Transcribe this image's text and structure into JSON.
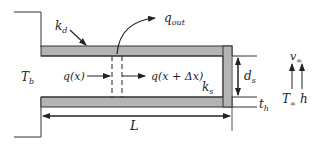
{
  "diagram": {
    "colors": {
      "wall_fill": "#b4b4b4",
      "wall_stroke": "#333333",
      "line": "#333333",
      "background": "#ffffff"
    },
    "labels": {
      "k_d": "k",
      "k_d_sub": "d",
      "q_out": "q",
      "q_out_sub": "out",
      "T_b": "T",
      "T_b_sub": "b",
      "q_x": "q(x)",
      "q_x_dx": "q(x + Δx)",
      "k_s": "k",
      "k_s_sub": "s",
      "d_s": "d",
      "d_s_sub": "s",
      "t_h": "t",
      "t_h_sub": "h",
      "L": "L",
      "v_inf": "v",
      "v_inf_sub": "∞",
      "T_inf": "T",
      "T_inf_sub": "∞",
      "h": "h"
    }
  }
}
